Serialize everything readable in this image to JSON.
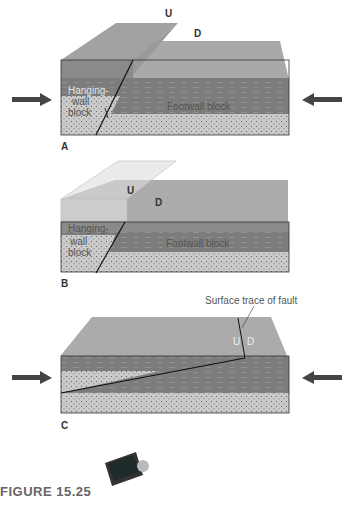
{
  "figure": {
    "caption": "FIGURE 15.25",
    "panels": [
      {
        "id": "A",
        "label": "A",
        "up_marker": "U",
        "down_marker": "D",
        "hanging_wall_label": [
          "Hanging-",
          "wall",
          "block"
        ],
        "footwall_label": "Footwall block"
      },
      {
        "id": "B",
        "label": "B",
        "up_marker": "U",
        "down_marker": "D",
        "hanging_wall_label": [
          "Hanging-",
          "wall",
          "block"
        ],
        "footwall_label": "Footwall block"
      },
      {
        "id": "C",
        "label": "C",
        "up_marker": "U",
        "down_marker": "D",
        "annotation": "Surface trace of fault"
      }
    ],
    "colors": {
      "surface": "#a8a8a8",
      "shale": "#7a7a7a",
      "shale_light": "#8e8e8e",
      "sand": "#c8c8c8",
      "line": "#222222",
      "arrow": "#444444"
    },
    "icons": [
      "compression-arrow-left",
      "compression-arrow-right",
      "tablet-icon"
    ]
  }
}
